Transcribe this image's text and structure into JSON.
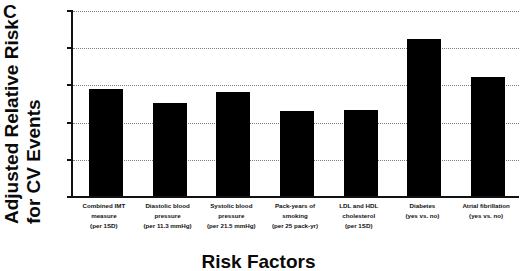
{
  "panel": {
    "label": "C"
  },
  "axis": {
    "y_title_line1": "Adjusted Relative Risk",
    "y_title_line2": "for CV Events",
    "x_title": "Risk Factors",
    "y_ticks": [
      "0",
      "0.5",
      "1",
      "1.5",
      "2",
      "2.5"
    ]
  },
  "chart_data": {
    "type": "bar",
    "title": "",
    "xlabel": "Risk Factors",
    "ylabel": "Adjusted Relative Risk for CV Events",
    "ylim": [
      0,
      2.5
    ],
    "ytick_values": [
      0,
      0.5,
      1,
      1.5,
      2,
      2.5
    ],
    "grid": true,
    "legend": "none",
    "bar_color": "#000000",
    "categories": [
      "Combined IMT measure (per 1SD)",
      "Diastolic blood pressure (per 11.3 mmHg)",
      "Systolic blood pressure (per 21.5 mmHg)",
      "Pack-years of smoking (per 25 pack-yr)",
      "LDL and HDL cholesterol (per 1SD)",
      "Diabetes (yes vs. no)",
      "Atrial fibrillation (yes vs. no)"
    ],
    "category_lines": [
      [
        "Combined IMT",
        "measure",
        "(per 1SD)"
      ],
      [
        "Diastolic blood",
        "pressure",
        "(per 11.3 mmHg)"
      ],
      [
        "Systolic blood",
        "pressure",
        "(per 21.5 mmHg)"
      ],
      [
        "Pack-years of",
        "smoking",
        "(per 25 pack-yr)"
      ],
      [
        "LDL and HDL",
        "cholesterol",
        "(per 1SD)"
      ],
      [
        "Diabetes",
        "(yes vs. no)",
        ""
      ],
      [
        "Atrial fibrillation",
        "(yes vs. no)",
        ""
      ]
    ],
    "values": [
      1.45,
      1.27,
      1.41,
      1.15,
      1.17,
      2.12,
      1.61
    ]
  }
}
